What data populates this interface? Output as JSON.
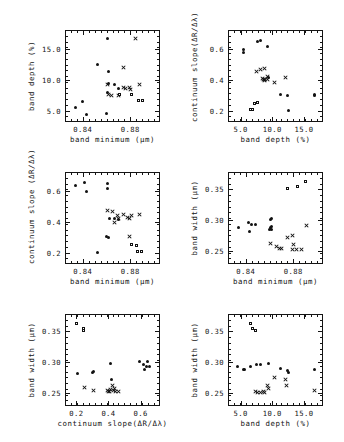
{
  "figure": {
    "marker_styles": {
      "filled_circle": "#111111",
      "cross": "#111111",
      "open_square": "#111111"
    }
  },
  "chart_data": [
    {
      "id": "p1",
      "type": "scatter",
      "title": "",
      "xlabel": "band minimum (µm)",
      "ylabel": "band depth (%)",
      "xlim": [
        0.825,
        0.905
      ],
      "ylim": [
        3.2,
        18.0
      ],
      "xticks": [
        0.84,
        0.88
      ],
      "xticklabels": [
        "0.84",
        "0.88"
      ],
      "yticks": [
        5.0,
        10.0,
        15.0
      ],
      "yticklabels": [
        "5.0",
        "10.0",
        "15.0"
      ],
      "grid": false,
      "legend": "none",
      "series": [
        {
          "name": "filled_circle",
          "marker": "circle",
          "points": [
            [
              0.8605,
              16.6
            ],
            [
              0.8525,
              12.4
            ],
            [
              0.862,
              11.3
            ],
            [
              0.8615,
              9.4
            ],
            [
              0.8665,
              9.3
            ],
            [
              0.8395,
              6.5
            ],
            [
              0.834,
              5.5
            ],
            [
              0.843,
              4.4
            ],
            [
              0.86,
              4.6
            ],
            [
              0.861,
              8.0
            ],
            [
              0.87,
              8.6
            ]
          ]
        },
        {
          "name": "cross",
          "marker": "x",
          "points": [
            [
              0.884,
              16.6
            ],
            [
              0.8745,
              12.0
            ],
            [
              0.8605,
              9.2
            ],
            [
              0.8615,
              7.6
            ],
            [
              0.8645,
              7.5
            ],
            [
              0.874,
              8.7
            ],
            [
              0.876,
              8.6
            ],
            [
              0.879,
              8.7
            ],
            [
              0.8805,
              8.4
            ],
            [
              0.888,
              9.3
            ],
            [
              0.87,
              7.4
            ]
          ]
        },
        {
          "name": "open_square",
          "marker": "square",
          "points": [
            [
              0.8715,
              7.6
            ],
            [
              0.8815,
              7.5
            ],
            [
              0.887,
              6.6
            ],
            [
              0.891,
              6.6
            ]
          ]
        }
      ]
    },
    {
      "id": "p2",
      "type": "scatter",
      "title": "",
      "xlabel": "band depth (%)",
      "ylabel": "continuum slope(ΔR∕Δλ)",
      "xlim": [
        3.0,
        18.0
      ],
      "ylim": [
        0.13,
        0.72
      ],
      "xticks": [
        5.0,
        10.0,
        15.0
      ],
      "xticklabels": [
        "5.0",
        "10.0",
        "15.0"
      ],
      "yticks": [
        0.2,
        0.4,
        0.6
      ],
      "yticklabels": [
        "0.2",
        "0.4",
        "0.6"
      ],
      "grid": false,
      "legend": "none",
      "series": [
        {
          "name": "filled_circle",
          "marker": "circle",
          "points": [
            [
              5.4,
              0.595
            ],
            [
              5.5,
              0.575
            ],
            [
              7.6,
              0.645
            ],
            [
              8.2,
              0.655
            ],
            [
              9.3,
              0.615
            ],
            [
              11.3,
              0.305
            ],
            [
              12.4,
              0.3
            ],
            [
              16.6,
              0.305
            ],
            [
              16.7,
              0.3
            ],
            [
              12.5,
              0.205
            ],
            [
              9.4,
              0.415
            ]
          ]
        },
        {
          "name": "cross",
          "marker": "x",
          "points": [
            [
              7.5,
              0.455
            ],
            [
              8.2,
              0.465
            ],
            [
              8.8,
              0.47
            ],
            [
              8.5,
              0.41
            ],
            [
              8.7,
              0.405
            ],
            [
              8.8,
              0.395
            ],
            [
              9.2,
              0.425
            ],
            [
              9.3,
              0.4
            ],
            [
              10.3,
              0.385
            ],
            [
              12.0,
              0.415
            ],
            [
              8.6,
              0.4
            ]
          ]
        },
        {
          "name": "open_square",
          "marker": "square",
          "points": [
            [
              7.3,
              0.245
            ],
            [
              7.8,
              0.25
            ],
            [
              7.0,
              0.205
            ],
            [
              6.6,
              0.205
            ]
          ]
        }
      ]
    },
    {
      "id": "p3",
      "type": "scatter",
      "title": "",
      "xlabel": "band minimum (µm)",
      "ylabel": "continuum slope (ΔR∕Δλ)",
      "xlim": [
        0.825,
        0.905
      ],
      "ylim": [
        0.13,
        0.72
      ],
      "xticks": [
        0.84,
        0.88
      ],
      "xticklabels": [
        "0.84",
        "0.88"
      ],
      "yticks": [
        0.2,
        0.4,
        0.6
      ],
      "yticklabels": [
        "0.2",
        "0.4",
        "0.6"
      ],
      "grid": false,
      "legend": "none",
      "series": [
        {
          "name": "filled_circle",
          "marker": "circle",
          "points": [
            [
              0.834,
              0.635
            ],
            [
              0.841,
              0.655
            ],
            [
              0.843,
              0.595
            ],
            [
              0.8605,
              0.645
            ],
            [
              0.861,
              0.615
            ],
            [
              0.86,
              0.305
            ],
            [
              0.8615,
              0.3
            ],
            [
              0.852,
              0.205
            ],
            [
              0.87,
              0.415
            ],
            [
              0.8625,
              0.425
            ],
            [
              0.867,
              0.42
            ]
          ]
        },
        {
          "name": "cross",
          "marker": "x",
          "points": [
            [
              0.8605,
              0.47
            ],
            [
              0.865,
              0.465
            ],
            [
              0.869,
              0.44
            ],
            [
              0.87,
              0.42
            ],
            [
              0.874,
              0.445
            ],
            [
              0.878,
              0.43
            ],
            [
              0.879,
              0.425
            ],
            [
              0.881,
              0.44
            ],
            [
              0.888,
              0.445
            ],
            [
              0.8665,
              0.395
            ],
            [
              0.879,
              0.305
            ]
          ]
        },
        {
          "name": "open_square",
          "marker": "square",
          "points": [
            [
              0.881,
              0.25
            ],
            [
              0.886,
              0.245
            ],
            [
              0.89,
              0.205
            ],
            [
              0.8865,
              0.205
            ]
          ]
        }
      ]
    },
    {
      "id": "p4",
      "type": "scatter",
      "title": "",
      "xlabel": "band minimum (µm)",
      "ylabel": "band width (µm)",
      "xlim": [
        0.825,
        0.905
      ],
      "ylim": [
        0.228,
        0.378
      ],
      "xticks": [
        0.84,
        0.88
      ],
      "xticklabels": [
        "0.84",
        "0.88"
      ],
      "yticks": [
        0.25,
        0.3,
        0.35
      ],
      "yticklabels": [
        "0.25",
        "0.30",
        "0.35"
      ],
      "grid": false,
      "legend": "none",
      "series": [
        {
          "name": "filled_circle",
          "marker": "circle",
          "points": [
            [
              0.834,
              0.287
            ],
            [
              0.842,
              0.295
            ],
            [
              0.845,
              0.293
            ],
            [
              0.843,
              0.281
            ],
            [
              0.8605,
              0.3
            ],
            [
              0.8615,
              0.303
            ],
            [
              0.861,
              0.287
            ],
            [
              0.86,
              0.285
            ],
            [
              0.848,
              0.292
            ],
            [
              0.862,
              0.289
            ],
            [
              0.8615,
              0.284
            ]
          ]
        },
        {
          "name": "cross",
          "marker": "x",
          "points": [
            [
              0.8605,
              0.262
            ],
            [
              0.866,
              0.256
            ],
            [
              0.868,
              0.254
            ],
            [
              0.87,
              0.253
            ],
            [
              0.8755,
              0.272
            ],
            [
              0.879,
              0.274
            ],
            [
              0.88,
              0.26
            ],
            [
              0.879,
              0.252
            ],
            [
              0.883,
              0.252
            ],
            [
              0.887,
              0.252
            ],
            [
              0.891,
              0.29
            ]
          ]
        },
        {
          "name": "open_square",
          "marker": "square",
          "points": [
            [
              0.8755,
              0.351
            ],
            [
              0.884,
              0.353
            ],
            [
              0.8905,
              0.361
            ]
          ]
        }
      ]
    },
    {
      "id": "p5",
      "type": "scatter",
      "title": "",
      "xlabel": "continuum slope(ΔR∕Δλ)",
      "ylabel": "band width (µm)",
      "xlim": [
        0.13,
        0.72
      ],
      "ylim": [
        0.228,
        0.378
      ],
      "xticks": [
        0.2,
        0.4,
        0.6
      ],
      "xticklabels": [
        "0.2",
        "0.4",
        "0.6"
      ],
      "yticks": [
        0.25,
        0.3,
        0.35
      ],
      "yticklabels": [
        "0.25",
        "0.30",
        "0.35"
      ],
      "grid": false,
      "legend": "none",
      "series": [
        {
          "name": "filled_circle",
          "marker": "circle",
          "points": [
            [
              0.595,
              0.3
            ],
            [
              0.615,
              0.295
            ],
            [
              0.635,
              0.292
            ],
            [
              0.645,
              0.3
            ],
            [
              0.655,
              0.293
            ],
            [
              0.625,
              0.287
            ],
            [
              0.205,
              0.281
            ],
            [
              0.3,
              0.283
            ],
            [
              0.305,
              0.285
            ],
            [
              0.415,
              0.297
            ],
            [
              0.42,
              0.272
            ]
          ]
        },
        {
          "name": "cross",
          "marker": "x",
          "points": [
            [
              0.25,
              0.258
            ],
            [
              0.305,
              0.254
            ],
            [
              0.395,
              0.253
            ],
            [
              0.4,
              0.252
            ],
            [
              0.405,
              0.252
            ],
            [
              0.41,
              0.255
            ],
            [
              0.425,
              0.262
            ],
            [
              0.43,
              0.253
            ],
            [
              0.44,
              0.256
            ],
            [
              0.445,
              0.251
            ],
            [
              0.465,
              0.252
            ]
          ]
        },
        {
          "name": "open_square",
          "marker": "square",
          "points": [
            [
              0.205,
              0.361
            ],
            [
              0.245,
              0.353
            ],
            [
              0.25,
              0.351
            ]
          ]
        }
      ]
    },
    {
      "id": "p6",
      "type": "scatter",
      "title": "",
      "xlabel": "band depth (%)",
      "ylabel": "band width (µm)",
      "xlim": [
        3.0,
        18.0
      ],
      "ylim": [
        0.228,
        0.378
      ],
      "xticks": [
        5.0,
        10.0,
        15.0
      ],
      "xticklabels": [
        "5.0",
        "10.0",
        "15.0"
      ],
      "yticks": [
        0.25,
        0.3,
        0.35
      ],
      "yticklabels": [
        "0.25",
        "0.30",
        "0.35"
      ],
      "grid": false,
      "legend": "none",
      "series": [
        {
          "name": "filled_circle",
          "marker": "circle",
          "points": [
            [
              4.5,
              0.293
            ],
            [
              5.4,
              0.288
            ],
            [
              6.6,
              0.292
            ],
            [
              7.5,
              0.295
            ],
            [
              8.2,
              0.295
            ],
            [
              9.4,
              0.297
            ],
            [
              11.3,
              0.289
            ],
            [
              12.4,
              0.286
            ],
            [
              12.6,
              0.283
            ],
            [
              16.6,
              0.288
            ],
            [
              5.6,
              0.287
            ]
          ]
        },
        {
          "name": "cross",
          "marker": "x",
          "points": [
            [
              7.4,
              0.252
            ],
            [
              7.6,
              0.25
            ],
            [
              8.2,
              0.25
            ],
            [
              8.6,
              0.251
            ],
            [
              9.3,
              0.262
            ],
            [
              9.4,
              0.257
            ],
            [
              10.3,
              0.274
            ],
            [
              12.0,
              0.272
            ],
            [
              12.2,
              0.262
            ],
            [
              16.6,
              0.253
            ],
            [
              8.8,
              0.25
            ]
          ]
        },
        {
          "name": "open_square",
          "marker": "square",
          "points": [
            [
              6.6,
              0.362
            ],
            [
              7.0,
              0.353
            ],
            [
              7.4,
              0.351
            ]
          ]
        }
      ]
    }
  ]
}
